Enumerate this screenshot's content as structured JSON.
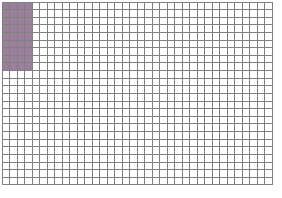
{
  "figure": {
    "name": "grid-fraction-diagram",
    "type": "grid",
    "background_color": "#ffffff"
  },
  "chart_data": {
    "type": "heatmap",
    "title": "",
    "subtitle": "",
    "xlabel": "",
    "ylabel": "",
    "columns": 36,
    "rows": 24,
    "total_cells": 864,
    "filled_cells": 36,
    "filled_region": {
      "start_column": 1,
      "end_column": 4,
      "start_row": 1,
      "end_row": 9,
      "columns_spanned": 4,
      "rows_spanned": 9
    },
    "legend": [],
    "annotations": [],
    "grid": true,
    "tick_labels": {
      "x": [],
      "y": []
    }
  },
  "style": {
    "fill_color": "#9c7f9c",
    "empty_color": "#ffffff",
    "grid_line_color": "#808080",
    "grid_line_width": 1,
    "cell_width": 7.5,
    "cell_height": 7.62,
    "origin_x": 2,
    "origin_y": 2
  }
}
